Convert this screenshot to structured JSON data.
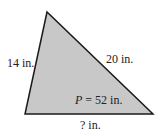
{
  "diagram": {
    "shape": "triangle",
    "fill_color": "#c8c8c8",
    "stroke_color": "#1a1a1a",
    "vertices": [
      [
        47,
        12
      ],
      [
        25,
        114
      ],
      [
        153,
        114
      ]
    ],
    "sides": {
      "left": "14 in.",
      "right": "20 in.",
      "bottom": "? in."
    },
    "perimeter": {
      "var": "P",
      "rest": " = 52 in."
    }
  }
}
